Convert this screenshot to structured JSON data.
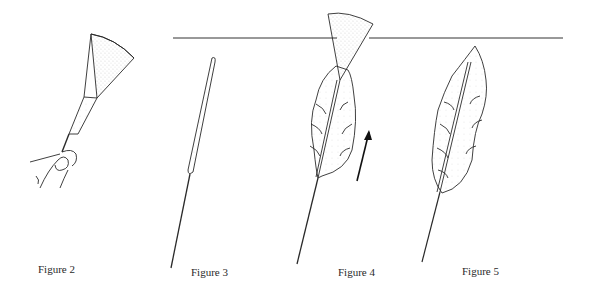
{
  "figures": [
    {
      "id": "figure-2",
      "caption": "Figure 2",
      "subject": "fan-shaped tuft held by fingers on a needle"
    },
    {
      "id": "figure-3",
      "caption": "Figure 3",
      "subject": "narrow elongated roll on a needle"
    },
    {
      "id": "figure-4",
      "caption": "Figure 4",
      "subject": "leaf-shaped form with fan tip crossing a horizontal line, upward arrow"
    },
    {
      "id": "figure-5",
      "caption": "Figure 5",
      "subject": "finished pointed leaf-shaped form on a needle"
    }
  ],
  "annotations": {
    "arrow_direction": "up",
    "horizontal_line": true
  },
  "colors": {
    "ink": "#2a2a2a",
    "background": "#ffffff"
  }
}
